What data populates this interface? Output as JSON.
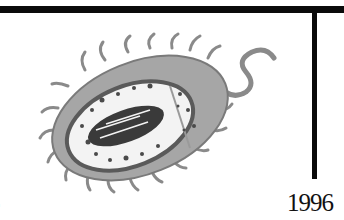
{
  "timeline": {
    "left_label_fragment": "5",
    "right_label": "1996"
  },
  "illustration": {
    "subject": "bacterium",
    "style": "grayscale watercolor",
    "colors": {
      "body": "#9a9a9a",
      "body_dark": "#6e6e6e",
      "membrane": "#5a5a5a",
      "interior": "#f3f3f3",
      "nucleoid": "#3a3a3a",
      "dots": "#4a4a4a"
    }
  },
  "colors": {
    "rule": "#0a0a0a",
    "background": "#ffffff",
    "text": "#111111"
  }
}
